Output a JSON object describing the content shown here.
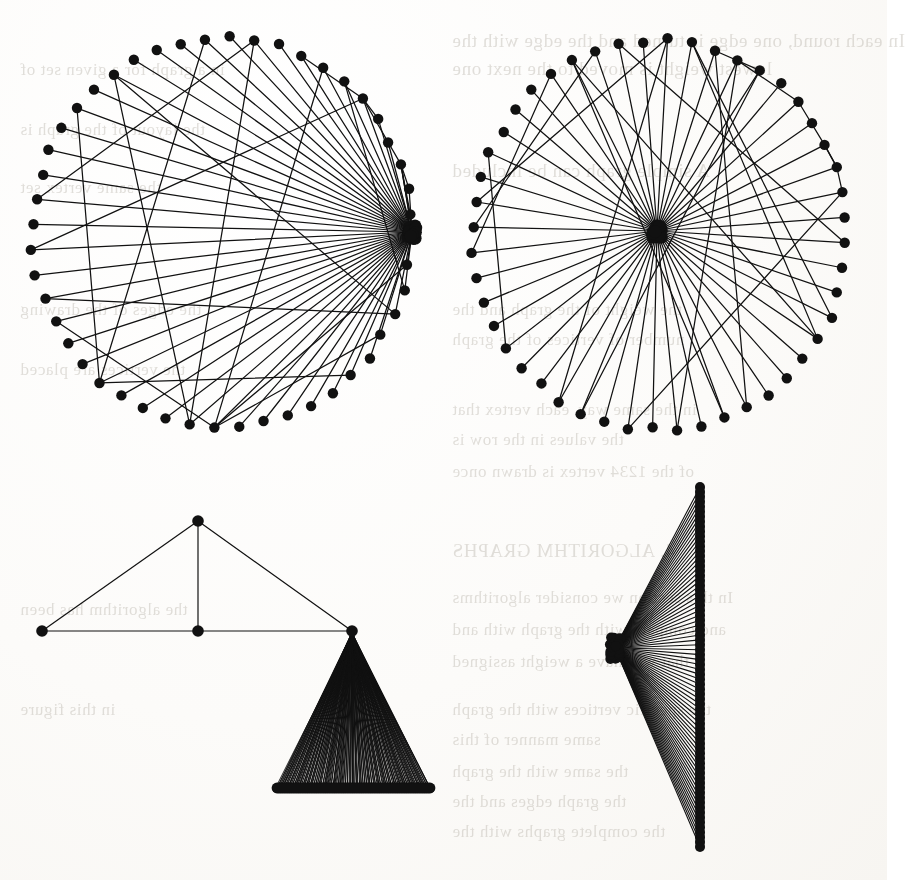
{
  "page": {
    "kind": "scanned-book-page-figure",
    "background_color": "#fbfaf8",
    "ink_color": "#111111",
    "width": 887,
    "height": 880
  },
  "ghost_text": {
    "note": "faint show-through text from the reverse side of the scanned page",
    "color": "#b9b4ab",
    "lines": [
      {
        "text": "In each round, one edge is turned and the edge with the",
        "x": 452,
        "y": 30,
        "size": 19
      },
      {
        "text": "lowest weight is moved to the next one",
        "x": 452,
        "y": 58,
        "size": 19
      },
      {
        "text": "A simple graph can be included",
        "x": 452,
        "y": 160,
        "size": 19
      },
      {
        "text": "the weight of the graph and the",
        "x": 452,
        "y": 300,
        "size": 17
      },
      {
        "text": "number of vertices of the graph",
        "x": 452,
        "y": 330,
        "size": 17
      },
      {
        "text": "in the same way, each vertex that",
        "x": 452,
        "y": 400,
        "size": 17
      },
      {
        "text": "the values in the row is",
        "x": 452,
        "y": 430,
        "size": 17
      },
      {
        "text": "of the 1234 vertex is drawn once",
        "x": 452,
        "y": 462,
        "size": 17
      },
      {
        "text": "4. ALGORITHM GRAPHS",
        "x": 452,
        "y": 540,
        "size": 19
      },
      {
        "text": "In this section we consider algorithms",
        "x": 452,
        "y": 588,
        "size": 17
      },
      {
        "text": "and compare with the graph with and",
        "x": 452,
        "y": 620,
        "size": 17
      },
      {
        "text": "that will have a weight assigned",
        "x": 452,
        "y": 652,
        "size": 17
      },
      {
        "text": "the specific vertices with the graph",
        "x": 452,
        "y": 700,
        "size": 17
      },
      {
        "text": "same manner of this",
        "x": 452,
        "y": 730,
        "size": 17
      },
      {
        "text": "the same with the graph",
        "x": 452,
        "y": 762,
        "size": 17
      },
      {
        "text": "the graph edges and the",
        "x": 452,
        "y": 792,
        "size": 17
      },
      {
        "text": "the complete graphs with the",
        "x": 452,
        "y": 822,
        "size": 17
      },
      {
        "text": "in a graph for a given set of",
        "x": 20,
        "y": 60,
        "size": 17
      },
      {
        "text": "the layout of the graph is",
        "x": 20,
        "y": 120,
        "size": 17
      },
      {
        "text": "the same vertex set",
        "x": 20,
        "y": 178,
        "size": 17
      },
      {
        "text": "the edges of the drawing",
        "x": 20,
        "y": 300,
        "size": 17
      },
      {
        "text": "the vertices are placed",
        "x": 20,
        "y": 360,
        "size": 17
      },
      {
        "text": "the algorithm has been",
        "x": 20,
        "y": 600,
        "size": 17
      },
      {
        "text": "in this figure",
        "x": 20,
        "y": 700,
        "size": 17
      }
    ]
  },
  "figures": [
    {
      "id": "fig-top-left",
      "name": "circular-layout-offset-hub-graph",
      "caption_visible": false,
      "layout": "circular",
      "node_count": 48,
      "center": {
        "x": 222,
        "y": 232
      },
      "radius_x": 190,
      "radius_y": 195,
      "hub": {
        "x": 412,
        "y": 232,
        "label": "high-degree-hub-at-circle-rim"
      },
      "node_radius": 5.2,
      "edge_width": 1.25,
      "extra_long_chords": 14,
      "description": "Circular node layout; nearly every node has an edge to a single hub node located on the right rim of the circle, producing a dense convergence; a handful of long chords cross the interior."
    },
    {
      "id": "fig-top-right",
      "name": "circular-layout-center-hub-graph",
      "caption_visible": false,
      "layout": "circular",
      "node_count": 48,
      "center": {
        "x": 660,
        "y": 235
      },
      "radius_x": 187,
      "radius_y": 195,
      "hub": {
        "x": 657,
        "y": 231,
        "label": "high-degree-hub-at-circle-center"
      },
      "node_radius": 5.2,
      "edge_width": 1.25,
      "extra_long_chords": 14,
      "description": "Same circular node layout but the hub node is drawn at the centre of the circle, so the spokes radiate evenly like a wheel; several long chords cross near the rim."
    },
    {
      "id": "fig-bottom-left",
      "name": "triangle-with-dense-fan-graph",
      "caption_visible": false,
      "layout": "triangle-plus-fan",
      "triangle_vertices": [
        {
          "x": 198,
          "y": 521,
          "name": "apex"
        },
        {
          "x": 42,
          "y": 631,
          "name": "left"
        },
        {
          "x": 198,
          "y": 631,
          "name": "middle"
        },
        {
          "x": 352,
          "y": 631,
          "name": "right-fan-apex"
        }
      ],
      "fan": {
        "apex": {
          "x": 352,
          "y": 633
        },
        "baseline_y": 788,
        "baseline_x_start": 277,
        "baseline_x_end": 430,
        "leaf_count": 86
      },
      "node_radius": 5.4,
      "edge_width": 1.2,
      "description": "A small 4-vertex triangle-shaped skeleton; the right-hand vertex carries a very dense fan of edges down to a tightly packed horizontal row of leaf nodes which merge into a solid black bar."
    },
    {
      "id": "fig-bottom-right",
      "name": "vertical-column-fan-graph",
      "caption_visible": false,
      "layout": "fan-to-vertical-column",
      "apex": {
        "x": 615,
        "y": 648
      },
      "apex_cluster_count": 5,
      "column": {
        "x": 700,
        "y_start": 487,
        "y_end": 847,
        "node_count": 74
      },
      "node_radius": 5.0,
      "edge_width": 1.1,
      "description": "A single apex (small cluster of overlapping nodes) on the left with edges fanning out to a dense vertical column of nodes on the right, forming a narrow triangular wedge."
    }
  ]
}
